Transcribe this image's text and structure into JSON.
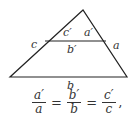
{
  "figure": {
    "vertices": {
      "apex": [
        83,
        10
      ],
      "bottom_left": [
        10,
        77
      ],
      "bottom_right": [
        127,
        77
      ],
      "mid_left": [
        45,
        41
      ],
      "mid_right": [
        106,
        41
      ]
    },
    "labels": {
      "c_prime": "c′",
      "a_prime": "a′",
      "c": "c",
      "b_prime": "b′",
      "a": "a",
      "b": "b"
    },
    "stroke_color": "#222222"
  },
  "equation": {
    "fractions": [
      {
        "num": "a′",
        "den": "a"
      },
      {
        "num": "b′",
        "den": "b"
      },
      {
        "num": "c′",
        "den": "c"
      }
    ],
    "equals": "=",
    "terminal": ","
  }
}
